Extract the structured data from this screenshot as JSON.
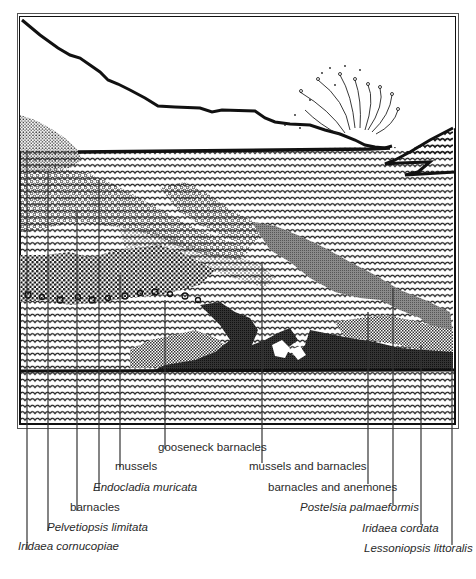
{
  "figure": {
    "type": "rocky intertidal zonation illustration",
    "colors": {
      "ink": "#111111",
      "mid_gray": "#777777",
      "dark": "#222222",
      "paper": "#ffffff"
    }
  },
  "labels": [
    {
      "id": "iridaea-cornucopiae",
      "text": "Iridaea cornucopiae",
      "italic": true,
      "line_x": 27,
      "line_top": 150,
      "text_x": 18,
      "text_y": 548
    },
    {
      "id": "pelvetiopsis-limitata",
      "text": "Pelvetiopsis limitata",
      "italic": true,
      "line_x": 48,
      "line_top": 172,
      "text_x": 47,
      "text_y": 529
    },
    {
      "id": "barnacles",
      "text": "barnacles",
      "italic": false,
      "line_x": 77,
      "line_top": 210,
      "text_x": 70,
      "text_y": 510
    },
    {
      "id": "endocladia-muricata",
      "text": "Endocladia muricata",
      "italic": true,
      "line_x": 99,
      "line_top": 180,
      "text_x": 93,
      "text_y": 490
    },
    {
      "id": "mussels",
      "text": "mussels",
      "italic": false,
      "line_x": 120,
      "line_top": 275,
      "text_x": 115,
      "text_y": 469
    },
    {
      "id": "gooseneck-barnacles",
      "text": "gooseneck barnacles",
      "italic": false,
      "line_x": 165,
      "line_top": 300,
      "text_x": 158,
      "text_y": 450
    },
    {
      "id": "mussels-and-barnacles",
      "text": "mussels and barnacles",
      "italic": false,
      "line_x": 262,
      "line_top": 262,
      "text_x": 249,
      "text_y": 470
    },
    {
      "id": "barnacles-and-anemones",
      "text": "barnacles and anemones",
      "italic": false,
      "line_x": 368,
      "line_top": 312,
      "text_x": 268,
      "text_y": 491
    },
    {
      "id": "postelsia-palmaeformis",
      "text": "Postelsia palmaeformis",
      "italic": true,
      "line_x": 393,
      "line_top": 288,
      "text_x": 300,
      "text_y": 511
    },
    {
      "id": "iridaea-cordata",
      "text": "Iridaea cordata",
      "italic": true,
      "line_x": 421,
      "line_top": 345,
      "text_x": 362,
      "text_y": 532
    },
    {
      "id": "lessoniopsis-littoralis",
      "text": "Lessoniopsis littoralis",
      "italic": true,
      "line_x": 452,
      "line_top": 360,
      "text_x": 364,
      "text_y": 552
    }
  ],
  "line_bottoms": {
    "iridaea-cornucopiae": 550,
    "pelvetiopsis-limitata": 531,
    "barnacles": 511,
    "endocladia-muricata": 491,
    "mussels": 467,
    "gooseneck-barnacles": 449,
    "mussels-and-barnacles": 463,
    "barnacles-and-anemones": 484,
    "postelsia-palmaeformis": 505,
    "iridaea-cordata": 525,
    "lessoniopsis-littoralis": 545
  }
}
